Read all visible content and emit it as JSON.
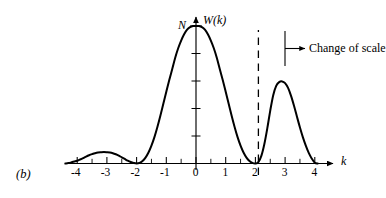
{
  "figure": {
    "panel_label": "(b)",
    "y_axis_label": "W(k)",
    "x_axis_label": "k",
    "peak_value_label": "N",
    "annotation": "Change of scale",
    "line_color": "#000000",
    "axis_color": "#000000",
    "dashed_line_color": "#000000",
    "background": "#ffffff"
  },
  "chart_data": {
    "type": "line",
    "title": "",
    "xlabel": "k",
    "ylabel": "W(k)",
    "xlim": [
      -4.4,
      4.4
    ],
    "ylim": [
      0,
      1.05
    ],
    "grid": false,
    "legend": null,
    "x_ticks": [
      -4,
      -3,
      -2,
      -1,
      0,
      1,
      2,
      3,
      4
    ],
    "x_tick_labels": [
      "-4",
      "-3",
      "-2",
      "-1",
      "0",
      "1",
      "2",
      "3",
      "4"
    ],
    "x_minor_ticks": [
      -3.5,
      -2.5,
      -1.5,
      -0.5,
      0.5,
      1.5,
      2.5,
      3.5
    ],
    "y_ticks": [
      0.2,
      0.4,
      0.6,
      0.8,
      1.0
    ],
    "y_tick_labels": [
      "",
      "",
      "",
      "",
      "N"
    ],
    "annotations": [
      {
        "text": "N",
        "x": 0,
        "y": 1.0,
        "note": "peak amplitude marker on y-axis"
      },
      {
        "text": "Change of scale",
        "x": 2.1,
        "y": 0.78,
        "note": "arrow points right from dashed line"
      },
      {
        "text": "(b)",
        "x": -4.35,
        "y": -0.12,
        "note": "figure panel label"
      }
    ],
    "markers": [
      {
        "type": "vertical-dashed-line",
        "x": 2.1,
        "y_from": 0.0,
        "y_to": 0.92
      }
    ],
    "series": [
      {
        "name": "W(k)",
        "x": [
          -4.4,
          -4.3,
          -4.2,
          -4.1,
          -4.0,
          -3.9,
          -3.8,
          -3.7,
          -3.6,
          -3.5,
          -3.4,
          -3.3,
          -3.2,
          -3.1,
          -3.0,
          -2.9,
          -2.8,
          -2.7,
          -2.6,
          -2.5,
          -2.4,
          -2.3,
          -2.2,
          -2.1,
          -2.0,
          -1.9,
          -1.8,
          -1.7,
          -1.6,
          -1.5,
          -1.4,
          -1.3,
          -1.2,
          -1.1,
          -1.0,
          -0.9,
          -0.8,
          -0.7,
          -0.6,
          -0.5,
          -0.4,
          -0.3,
          -0.2,
          -0.1,
          0.0,
          0.1,
          0.2,
          0.3,
          0.4,
          0.5,
          0.6,
          0.7,
          0.8,
          0.9,
          1.0,
          1.1,
          1.2,
          1.3,
          1.4,
          1.5,
          1.6,
          1.7,
          1.8,
          1.9,
          2.0,
          2.1,
          2.2,
          2.3,
          2.4,
          2.5,
          2.6,
          2.7,
          2.8,
          2.9,
          3.0,
          3.1,
          3.2,
          3.3,
          3.4,
          3.5,
          3.6,
          3.7,
          3.8,
          3.9,
          4.0,
          4.1
        ],
        "y": [
          0.0,
          0.003,
          0.008,
          0.014,
          0.02,
          0.029,
          0.039,
          0.05,
          0.06,
          0.068,
          0.075,
          0.08,
          0.082,
          0.083,
          0.082,
          0.08,
          0.075,
          0.067,
          0.057,
          0.045,
          0.033,
          0.021,
          0.011,
          0.004,
          0.0,
          0.004,
          0.018,
          0.043,
          0.08,
          0.13,
          0.192,
          0.266,
          0.348,
          0.435,
          0.522,
          0.607,
          0.687,
          0.769,
          0.838,
          0.894,
          0.94,
          0.973,
          0.992,
          1.0,
          1.0,
          1.0,
          0.992,
          0.973,
          0.94,
          0.894,
          0.838,
          0.769,
          0.687,
          0.607,
          0.522,
          0.435,
          0.348,
          0.266,
          0.192,
          0.13,
          0.08,
          0.043,
          0.018,
          0.004,
          0.0,
          0.01,
          0.055,
          0.14,
          0.255,
          0.385,
          0.497,
          0.565,
          0.592,
          0.597,
          0.585,
          0.55,
          0.492,
          0.42,
          0.34,
          0.262,
          0.19,
          0.128,
          0.075,
          0.035,
          0.006,
          0.0
        ]
      }
    ]
  }
}
